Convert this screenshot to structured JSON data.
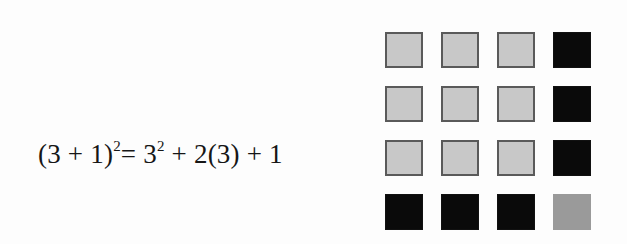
{
  "equation": {
    "lhs_open": "(3 + 1)",
    "lhs_exp": "2",
    "eq": "= 3",
    "rhs_exp": "2",
    "rhs_rest": " + 2(3) + 1"
  },
  "grid": {
    "rows": 4,
    "cols": 4,
    "cells": [
      [
        "light",
        "light",
        "light",
        "dark"
      ],
      [
        "light",
        "light",
        "light",
        "dark"
      ],
      [
        "light",
        "light",
        "light",
        "dark"
      ],
      [
        "dark",
        "dark",
        "dark",
        "mid"
      ]
    ],
    "legend": {
      "light": "3² square (9 units)",
      "dark": "2(3) strips (6 units)",
      "mid": "1 unit"
    },
    "colors": {
      "light": "#c8c8c8",
      "dark": "#0a0a0a",
      "mid": "#9a9a9a",
      "border": "#5a5a5a"
    }
  }
}
